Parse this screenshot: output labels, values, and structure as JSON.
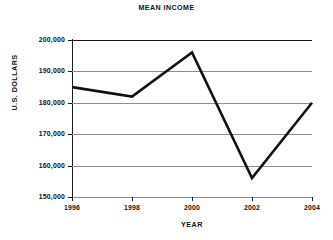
{
  "chart_data": {
    "type": "line",
    "title": "MEAN INCOME",
    "xlabel": "YEAR",
    "ylabel": "U.S. DOLLARS",
    "x": [
      1996,
      1998,
      2000,
      2002,
      2004
    ],
    "categories": [
      "1996",
      "1998",
      "2000",
      "2002",
      "2004"
    ],
    "values": [
      185000,
      182000,
      196000,
      156000,
      180000
    ],
    "series": [
      {
        "name": "Mean income",
        "values": [
          185000,
          182000,
          196000,
          156000,
          180000
        ]
      }
    ],
    "xlim": [
      1996,
      2004
    ],
    "ylim": [
      150000,
      200000
    ],
    "ytick_values": [
      150000,
      160000,
      170000,
      180000,
      190000,
      200000
    ],
    "ytick_labels": [
      "150,000",
      "160,000",
      "170,000",
      "180,000",
      "190,000",
      "200,000"
    ],
    "xtick_labels": [
      "1996",
      "1998",
      "2000",
      "2002",
      "2004"
    ],
    "grid": "horizontal",
    "legend": "none",
    "line_color": "#111111",
    "grid_color": "#8d8d8d",
    "axis_color": "#1a1a1a",
    "background_color": "#ffffff"
  }
}
